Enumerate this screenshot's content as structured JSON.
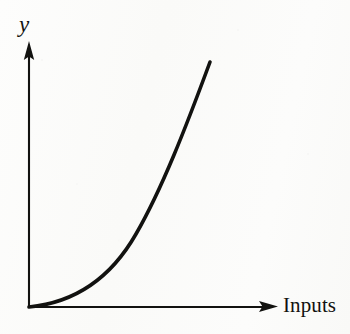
{
  "figure": {
    "type": "line-diagram",
    "background_color": "#fcfcfb",
    "ink_color": "#121210",
    "y_axis_label": "y",
    "x_axis_label": "Inputs"
  },
  "chart_data": {
    "type": "line",
    "title": "",
    "subtitle": "",
    "xlabel": "Inputs",
    "ylabel": "y",
    "grid": false,
    "legend": null,
    "axes": {
      "x_axis": {
        "label": "Inputs",
        "has_arrowhead": true,
        "tick_labels": [],
        "origin_px": [
          29,
          307
        ],
        "end_px": [
          277,
          307
        ]
      },
      "y_axis": {
        "label": "y",
        "has_arrowhead": true,
        "tick_labels": [],
        "origin_px": [
          29,
          307
        ],
        "end_px": [
          29,
          42
        ]
      }
    },
    "xlim": [
      0,
      1
    ],
    "ylim": [
      0,
      1
    ],
    "annotations": [],
    "series": [
      {
        "name": "output curve",
        "shape": "convex increasing",
        "stroke_color": "#121210",
        "stroke_width_px": 3.6,
        "x": [
          0.0,
          0.125,
          0.25,
          0.33,
          0.45,
          0.59,
          0.73,
          0.85,
          1.0
        ],
        "y": [
          0.0,
          0.06,
          0.17,
          0.24,
          0.36,
          0.53,
          0.7,
          0.82,
          1.0
        ],
        "points_px": [
          [
            29,
            307
          ],
          [
            60,
            292
          ],
          [
            91,
            276
          ],
          [
            112,
            260
          ],
          [
            140,
            213
          ],
          [
            163,
            180
          ],
          [
            183,
            140
          ],
          [
            198,
            103
          ],
          [
            210,
            62
          ]
        ],
        "path_d": "M 29 307 C 70 303, 108 283, 136 234 C 162 189, 186 127, 210 62"
      }
    ]
  }
}
